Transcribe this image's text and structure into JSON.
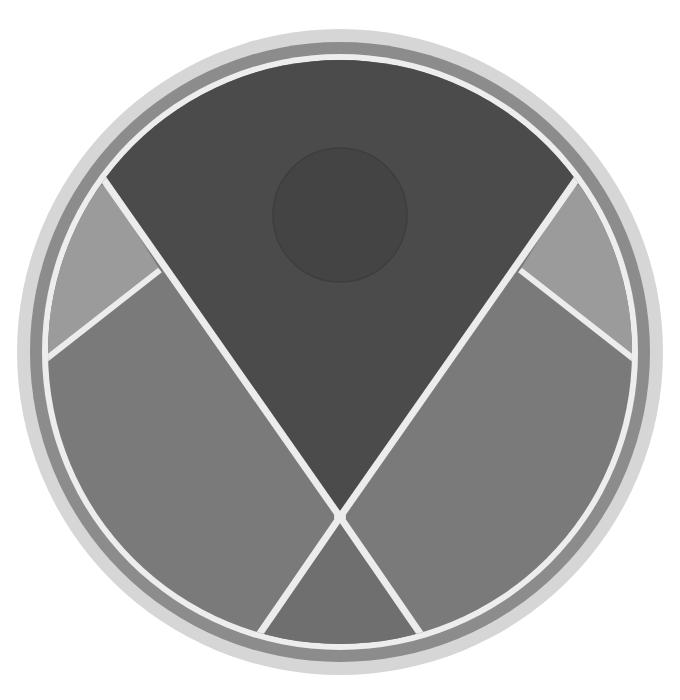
{
  "figure": {
    "type": "circular-emblem",
    "center": [
      340,
      352
    ],
    "rings": [
      {
        "name": "outer-ring",
        "radius": 323,
        "color": "#d6d6d6"
      },
      {
        "name": "middle-ring",
        "radius": 310,
        "color": "#8c8c8c"
      },
      {
        "name": "inner-white-ring",
        "radius": 298,
        "color": "#ededed"
      },
      {
        "name": "field",
        "radius": 291,
        "color": "#7b7b7b"
      }
    ],
    "regions": {
      "top-wedge": "#4b4b4b",
      "top-inner-circle": "#444444",
      "left-small-triangle": "#9b9b9b",
      "right-small-triangle": "#9b9b9b",
      "left-panel": "#7a7a7a",
      "right-panel": "#7a7a7a",
      "bottom-wedge": "#6f6f6f"
    },
    "divider_color": "#ececec"
  },
  "caption": {
    "text": ""
  }
}
